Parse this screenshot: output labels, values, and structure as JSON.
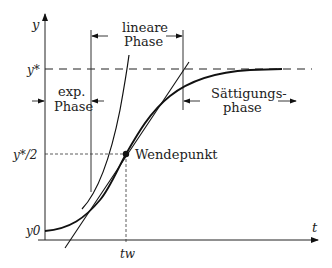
{
  "diagram": {
    "axes": {
      "y_label": "y",
      "x_label": "t",
      "y_star": "y*",
      "y_star_half": "y*/2",
      "y_zero": "y0",
      "t_w": "tw"
    },
    "phases": {
      "exp": [
        "exp.",
        "Phase"
      ],
      "linear": [
        "lineare",
        "Phase"
      ],
      "saturation": [
        "Sättigungs-",
        "phase"
      ]
    },
    "inflection_label": "Wendepunkt",
    "colors": {
      "line": "#111111",
      "text": "#222222",
      "background": "#ffffff"
    }
  }
}
